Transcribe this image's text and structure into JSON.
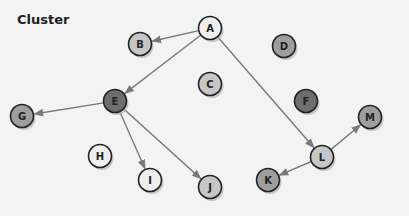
{
  "title": "Cluster",
  "colors": {
    "background": "#f3f3f3",
    "edge": "#7a7a7a",
    "stroke": "#222222",
    "shadow": "#b5b5b5"
  },
  "nodes": [
    {
      "id": "A",
      "x": 210,
      "y": 28,
      "fill": "#eeeeee"
    },
    {
      "id": "B",
      "x": 140,
      "y": 44,
      "fill": "#c6c6c6"
    },
    {
      "id": "C",
      "x": 210,
      "y": 84,
      "fill": "#c6c6c6"
    },
    {
      "id": "D",
      "x": 284,
      "y": 46,
      "fill": "#9e9e9e"
    },
    {
      "id": "E",
      "x": 115,
      "y": 101,
      "fill": "#6e6e6e"
    },
    {
      "id": "F",
      "x": 306,
      "y": 101,
      "fill": "#6e6e6e"
    },
    {
      "id": "G",
      "x": 22,
      "y": 116,
      "fill": "#9e9e9e"
    },
    {
      "id": "H",
      "x": 100,
      "y": 156,
      "fill": "#eeeeee"
    },
    {
      "id": "I",
      "x": 150,
      "y": 180,
      "fill": "#eeeeee"
    },
    {
      "id": "J",
      "x": 210,
      "y": 187,
      "fill": "#c6c6c6"
    },
    {
      "id": "K",
      "x": 268,
      "y": 180,
      "fill": "#9e9e9e"
    },
    {
      "id": "L",
      "x": 322,
      "y": 157,
      "fill": "#c6c6c6"
    },
    {
      "id": "M",
      "x": 370,
      "y": 117,
      "fill": "#9e9e9e"
    }
  ],
  "edges": [
    {
      "from": "A",
      "to": "B"
    },
    {
      "from": "A",
      "to": "E"
    },
    {
      "from": "A",
      "to": "L"
    },
    {
      "from": "E",
      "to": "G"
    },
    {
      "from": "E",
      "to": "I"
    },
    {
      "from": "E",
      "to": "J"
    },
    {
      "from": "L",
      "to": "K"
    },
    {
      "from": "L",
      "to": "M"
    }
  ]
}
